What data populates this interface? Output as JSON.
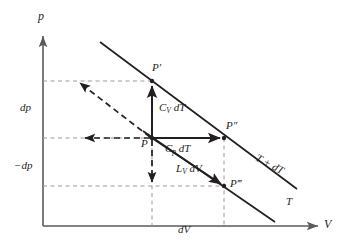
{
  "figure": {
    "title": "",
    "type": "thermodynamic p-V diagram with two isotherms",
    "colors": {
      "ink": "#231f20",
      "dashed_guide": "#8c8c8c",
      "background": "#ffffff"
    }
  },
  "axes": {
    "y_label": "p",
    "x_label": "V",
    "origin_label": ""
  },
  "ticks": {
    "y": [
      {
        "label": "dp",
        "value": "dp"
      },
      {
        "label": "−dp",
        "value": "-dp"
      }
    ],
    "x": [
      {
        "label": "dV",
        "value": "dV"
      }
    ]
  },
  "points": [
    {
      "name": "P",
      "label": "P"
    },
    {
      "name": "Pp",
      "label": "P′"
    },
    {
      "name": "Ppp",
      "label": "P″"
    },
    {
      "name": "Pppp",
      "label": "P‴"
    }
  ],
  "segments": [
    {
      "name": "cv-dt",
      "label_main": "C",
      "label_sub": "V",
      "label_tail": " dT"
    },
    {
      "name": "cp-dt",
      "label_main": "C",
      "label_sub": "p",
      "label_tail": " dT"
    },
    {
      "name": "lv-dv",
      "label_main": "L",
      "label_sub": "V",
      "label_tail": " dV"
    }
  ],
  "isotherms": [
    {
      "name": "upper",
      "label": "T + dT"
    },
    {
      "name": "lower",
      "label": "T"
    }
  ]
}
